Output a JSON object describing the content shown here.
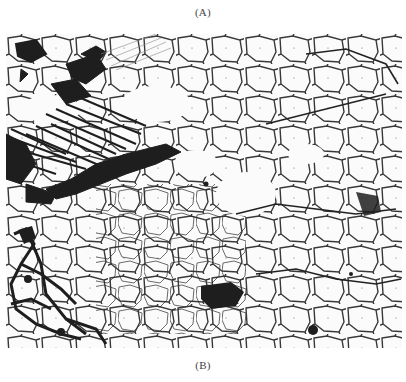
{
  "figure": {
    "top_label": "(A)",
    "bottom_label": "(B)",
    "image": {
      "type": "metallographic-micrograph",
      "description": "Black-and-white micrograph showing network of dark grain boundaries; dense dendritic/acicular dark regions at upper-left and lower-left",
      "colors": {
        "background": "#fbfbfb",
        "phase": "#1e1e1e"
      }
    }
  }
}
